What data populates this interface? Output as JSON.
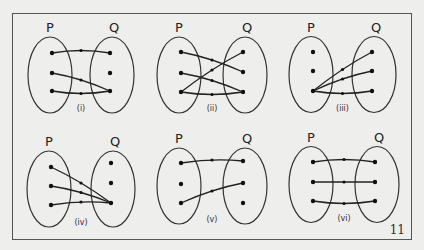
{
  "figure": {
    "page_number": "11",
    "set_labels": {
      "domain": "P",
      "codomain": "Q"
    },
    "panels": [
      {
        "id": "i",
        "label": "(i)",
        "origin": [
          50,
          78
        ],
        "p_dots": [
          [
            52,
            53
          ],
          [
            52,
            73
          ],
          [
            52,
            91
          ]
        ],
        "q_dots": [
          [
            110,
            53
          ],
          [
            110,
            73
          ],
          [
            110,
            91
          ]
        ],
        "mappings": [
          [
            0,
            0
          ],
          [
            1,
            2
          ],
          [
            2,
            2
          ]
        ]
      },
      {
        "id": "ii",
        "label": "(ii)",
        "origin": [
          181,
          78
        ],
        "p_dots": [
          [
            181,
            52
          ],
          [
            181,
            73
          ],
          [
            181,
            92
          ]
        ],
        "q_dots": [
          [
            243,
            52
          ],
          [
            243,
            72
          ],
          [
            243,
            92
          ]
        ],
        "mappings": [
          [
            0,
            1
          ],
          [
            1,
            2
          ],
          [
            2,
            0
          ],
          [
            2,
            2
          ]
        ]
      },
      {
        "id": "iii",
        "label": "(iii)",
        "origin": [
          313,
          78
        ],
        "p_dots": [
          [
            313,
            52
          ],
          [
            313,
            71
          ],
          [
            313,
            91
          ]
        ],
        "q_dots": [
          [
            372,
            52
          ],
          [
            372,
            71
          ],
          [
            372,
            91
          ]
        ],
        "mappings": [
          [
            2,
            0
          ],
          [
            2,
            1
          ],
          [
            2,
            2
          ]
        ]
      },
      {
        "id": "iv",
        "label": "(iv)",
        "origin": [
          51,
          190
        ],
        "p_dots": [
          [
            51,
            167
          ],
          [
            51,
            186
          ],
          [
            51,
            205
          ]
        ],
        "q_dots": [
          [
            111,
            163
          ],
          [
            111,
            183
          ],
          [
            111,
            203
          ]
        ],
        "mappings": [
          [
            0,
            2
          ],
          [
            1,
            2
          ],
          [
            2,
            2
          ]
        ]
      },
      {
        "id": "v",
        "label": "(v)",
        "origin": [
          181,
          188
        ],
        "p_dots": [
          [
            181,
            163
          ],
          [
            181,
            184
          ],
          [
            181,
            203
          ]
        ],
        "q_dots": [
          [
            243,
            161
          ],
          [
            243,
            183
          ],
          [
            243,
            203
          ]
        ],
        "mappings": [
          [
            0,
            0
          ],
          [
            2,
            1
          ]
        ]
      },
      {
        "id": "vi",
        "label": "(vi)",
        "origin": [
          313,
          186
        ],
        "p_dots": [
          [
            313,
            162
          ],
          [
            313,
            182
          ],
          [
            313,
            201
          ]
        ],
        "q_dots": [
          [
            375,
            162
          ],
          [
            375,
            182
          ],
          [
            375,
            201
          ]
        ],
        "mappings": [
          [
            0,
            0
          ],
          [
            1,
            1
          ],
          [
            2,
            2
          ]
        ]
      }
    ]
  }
}
